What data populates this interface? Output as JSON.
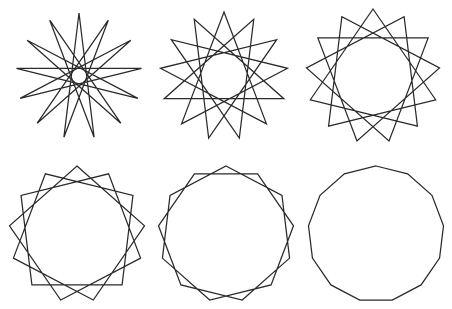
{
  "canvas": {
    "width": 452,
    "height": 309,
    "background_color": "#ffffff",
    "stroke_color": "#2a2a2a",
    "stroke_width": 1.25
  },
  "figure": {
    "vertex_count": 13,
    "rows": 2,
    "columns": 3
  },
  "chart_data": {
    "type": "scatter",
    "xlabel": "",
    "ylabel": "",
    "grid": false,
    "legend": "none",
    "panels": [
      {
        "index": 1,
        "name": "star-13-6",
        "schlafli": "{13/6}",
        "points": 13,
        "step": 6,
        "center_x": 79,
        "center_y": 76,
        "radius": 63,
        "rotation_deg": -90,
        "row": 1,
        "column": 1
      },
      {
        "index": 2,
        "name": "star-13-5",
        "schlafli": "{13/5}",
        "points": 13,
        "step": 5,
        "center_x": 224,
        "center_y": 76,
        "radius": 64,
        "rotation_deg": -90,
        "row": 1,
        "column": 2
      },
      {
        "index": 3,
        "name": "star-13-4",
        "schlafli": "{13/4}",
        "points": 13,
        "step": 4,
        "center_x": 373,
        "center_y": 76,
        "radius": 67,
        "rotation_deg": -90,
        "row": 1,
        "column": 3
      },
      {
        "index": 4,
        "name": "star-13-3",
        "schlafli": "{13/3}",
        "points": 13,
        "step": 3,
        "center_x": 77,
        "center_y": 234,
        "radius": 68,
        "rotation_deg": -90,
        "row": 2,
        "column": 1
      },
      {
        "index": 5,
        "name": "star-13-2",
        "schlafli": "{13/2}",
        "points": 13,
        "step": 2,
        "center_x": 226,
        "center_y": 234,
        "radius": 68,
        "rotation_deg": -90,
        "row": 2,
        "column": 2
      },
      {
        "index": 6,
        "name": "polygon-13-1",
        "schlafli": "{13/1}",
        "points": 13,
        "step": 1,
        "center_x": 376,
        "center_y": 234,
        "radius": 68,
        "rotation_deg": -90,
        "row": 2,
        "column": 3
      }
    ]
  }
}
